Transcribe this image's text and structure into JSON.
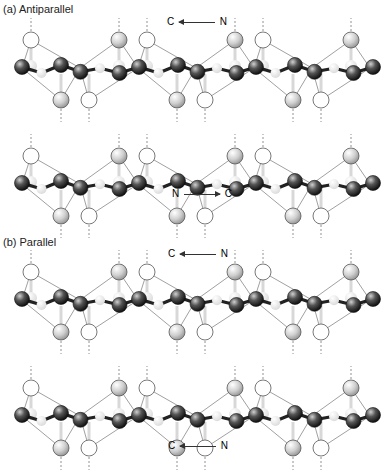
{
  "panels": [
    {
      "label": "(a) Antiparallel",
      "strands": [
        {
          "direction_text": [
            "C",
            "N"
          ],
          "arrow": "right-to-left"
        },
        {
          "direction_text": [
            "N",
            "C"
          ],
          "arrow": "left-to-right"
        }
      ]
    },
    {
      "label": "(b) Parallel",
      "strands": [
        {
          "direction_text": [
            "C",
            "N"
          ],
          "arrow": "right-to-left"
        },
        {
          "direction_text": [
            "C",
            "N"
          ],
          "arrow": "right-to-left"
        }
      ]
    }
  ],
  "colors": {
    "backbone": "#222222",
    "oxygen_fill": "#ffffff",
    "hydrogen_fill": "#c8c8c8",
    "line": "#888888",
    "hbond": "#777777"
  }
}
